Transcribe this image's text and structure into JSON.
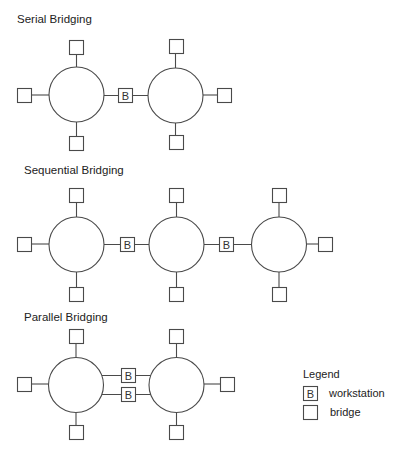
{
  "sections": [
    {
      "id": "serial",
      "title": "Serial Bridging",
      "title_pos": [
        17,
        23
      ],
      "rings": [
        {
          "cx": 76.5,
          "cy": 94.5,
          "r": 27.5,
          "stations": [
            {
              "side": "top",
              "x": 69,
              "y": 40
            },
            {
              "side": "left",
              "x": 17,
              "y": 88
            },
            {
              "side": "bottom",
              "x": 69,
              "y": 136
            }
          ]
        },
        {
          "cx": 175.5,
          "cy": 95.5,
          "r": 27.5,
          "stations": [
            {
              "side": "top",
              "x": 169,
              "y": 39
            },
            {
              "side": "right",
              "x": 217,
              "y": 88
            },
            {
              "side": "bottom",
              "x": 169,
              "y": 135
            }
          ]
        }
      ],
      "bridges": [
        {
          "label": "B",
          "x": 118,
          "y": 88,
          "from": [
            104,
            95.5
          ],
          "to": [
            148,
            95.5
          ]
        }
      ]
    },
    {
      "id": "sequential",
      "title": "Sequential Bridging",
      "title_pos": [
        24,
        174
      ],
      "rings": [
        {
          "cx": 76.5,
          "cy": 244.5,
          "r": 27.5,
          "stations": [
            {
              "side": "top",
              "x": 69,
              "y": 188
            },
            {
              "side": "left",
              "x": 17,
              "y": 237
            },
            {
              "side": "bottom",
              "x": 69,
              "y": 287
            }
          ]
        },
        {
          "cx": 176.5,
          "cy": 244.5,
          "r": 27.5,
          "stations": [
            {
              "side": "top",
              "x": 169,
              "y": 188
            },
            {
              "side": "bottom",
              "x": 169,
              "y": 287
            }
          ]
        },
        {
          "cx": 279,
          "cy": 244.5,
          "r": 27.5,
          "stations": [
            {
              "side": "top",
              "x": 272,
              "y": 188
            },
            {
              "side": "right",
              "x": 318,
              "y": 237
            },
            {
              "side": "bottom",
              "x": 272,
              "y": 287
            }
          ]
        }
      ],
      "bridges": [
        {
          "label": "B",
          "x": 120,
          "y": 237,
          "from": [
            104,
            244.5
          ],
          "to": [
            149,
            244.5
          ]
        },
        {
          "label": "B",
          "x": 219,
          "y": 237,
          "from": [
            204,
            244.5
          ],
          "to": [
            251.5,
            244.5
          ]
        }
      ]
    },
    {
      "id": "parallel",
      "title": "Parallel Bridging",
      "title_pos": [
        24,
        321
      ],
      "rings": [
        {
          "cx": 76,
          "cy": 385,
          "r": 27.5,
          "stations": [
            {
              "side": "top",
              "x": 69,
              "y": 329
            },
            {
              "side": "left",
              "x": 17,
              "y": 377
            },
            {
              "side": "bottom",
              "x": 69,
              "y": 425
            }
          ]
        },
        {
          "cx": 176.5,
          "cy": 385,
          "r": 27.5,
          "stations": [
            {
              "side": "top",
              "x": 169,
              "y": 329
            },
            {
              "side": "right",
              "x": 220,
              "y": 377
            },
            {
              "side": "bottom",
              "x": 169,
              "y": 425
            }
          ]
        }
      ],
      "bridges": [
        {
          "label": "B",
          "x": 121,
          "y": 368,
          "from": [
            101.5,
            375.5
          ],
          "to": [
            151,
            375.5
          ]
        },
        {
          "label": "B",
          "x": 121,
          "y": 387,
          "from": [
            101.5,
            394.5
          ],
          "to": [
            151,
            394.5
          ]
        }
      ]
    }
  ],
  "legend": {
    "title": "Legend",
    "items": [
      {
        "symbol": "B",
        "label": "workstation"
      },
      {
        "symbol": "",
        "label": "bridge"
      }
    ]
  },
  "colors": {
    "stroke": "#4a4a4a",
    "text": "#222222",
    "background": "#ffffff"
  }
}
